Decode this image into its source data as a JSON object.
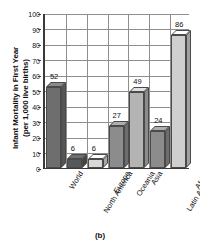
{
  "chart_data": {
    "type": "bar",
    "title": "",
    "xlabel": "",
    "ylabel": "Infant Mortality in First Year (per 1,000 live births)",
    "ylabel_line1": "Infant Mortality in First Year",
    "ylabel_line2": "(per 1,000 live births)",
    "ylim": [
      0,
      100
    ],
    "ytick_step": 10,
    "yticks": [
      "0",
      "10",
      "20",
      "30",
      "40",
      "50",
      "60",
      "70",
      "80",
      "90",
      "100"
    ],
    "grid": true,
    "legend": "none",
    "categories": [
      "World",
      "North America",
      "Europe",
      "Oceania",
      "Asia",
      "Latin America and the Caribbean",
      "Africa"
    ],
    "category_lines": [
      [
        "World"
      ],
      [
        "North America"
      ],
      [
        "Europe"
      ],
      [
        "Oceania"
      ],
      [
        "Asia"
      ],
      [
        "Latin America",
        "and the",
        "Caribbean"
      ],
      [
        "Africa"
      ]
    ],
    "values": [
      52,
      6,
      6,
      27,
      49,
      24,
      86
    ],
    "value_labels": [
      "52",
      "6",
      "6",
      "27",
      "49",
      "24",
      "86"
    ],
    "bar_colors": [
      "#6e6e6e",
      "#585858",
      "#d8d8d8",
      "#8c8c8c",
      "#b4b4b4",
      "#8c8c8c",
      "#cfcfcf"
    ]
  },
  "caption": "(b)"
}
